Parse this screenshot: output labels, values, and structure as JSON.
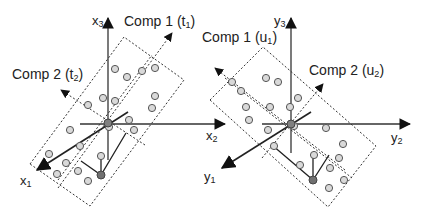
{
  "diagram": {
    "left_panel": {
      "axes": {
        "x1": "x",
        "x1_sub": "1",
        "x2": "x",
        "x2_sub": "2",
        "x3": "x",
        "x3_sub": "3"
      },
      "comp1": {
        "text": "Comp 1 (t",
        "sub": "1",
        "close": ")"
      },
      "comp2": {
        "text": "Comp 2 (t",
        "sub": "2",
        "close": ")"
      },
      "points": [
        [
          115,
          69
        ],
        [
          127,
          77
        ],
        [
          142,
          71
        ],
        [
          155,
          68
        ],
        [
          155,
          96
        ],
        [
          152,
          108
        ],
        [
          103,
          98
        ],
        [
          115,
          101
        ],
        [
          88,
          105
        ],
        [
          129,
          120
        ],
        [
          134,
          130
        ],
        [
          70,
          130
        ],
        [
          80,
          146
        ],
        [
          49,
          154
        ],
        [
          66,
          163
        ],
        [
          78,
          171
        ],
        [
          57,
          174
        ],
        [
          88,
          181
        ],
        [
          101,
          156
        ]
      ],
      "projected_point": [
        101,
        175
      ],
      "origin": [
        108,
        124
      ]
    },
    "right_panel": {
      "axes": {
        "y1": "y",
        "y1_sub": "1",
        "y2": "y",
        "y2_sub": "2",
        "y3": "y",
        "y3_sub": "3"
      },
      "comp1": {
        "text": "Comp 1 (u",
        "sub": "1",
        "close": ")"
      },
      "comp2": {
        "text": "Comp 2 (u",
        "sub": "2",
        "close": ")"
      },
      "points": [
        [
          266,
          78
        ],
        [
          278,
          82
        ],
        [
          232,
          82
        ],
        [
          241,
          91
        ],
        [
          246,
          107
        ],
        [
          249,
          120
        ],
        [
          270,
          111
        ],
        [
          298,
          98
        ],
        [
          290,
          107
        ],
        [
          270,
          130
        ],
        [
          326,
          128
        ],
        [
          274,
          146
        ],
        [
          343,
          144
        ],
        [
          314,
          155
        ],
        [
          339,
          158
        ],
        [
          330,
          168
        ],
        [
          299,
          165
        ],
        [
          344,
          180
        ],
        [
          329,
          188
        ]
      ],
      "projected_point": [
        313,
        180
      ],
      "origin": [
        291,
        124
      ]
    },
    "colors": {
      "point_fill": "#d9d9d9",
      "point_stroke": "#555555",
      "dark_point": "#707070",
      "line": "#222222"
    }
  }
}
